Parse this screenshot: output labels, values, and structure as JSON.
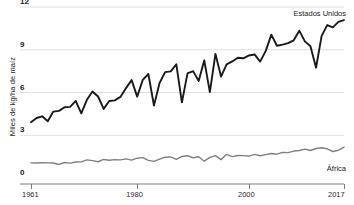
{
  "chart_data": {
    "type": "line",
    "title": "",
    "xlabel": "",
    "ylabel": "Miles de kg/ha de maíz",
    "xlim": [
      1961,
      2017
    ],
    "ylim": [
      0,
      12
    ],
    "grid": true,
    "legend_position": "inline-right",
    "yticks": [
      "0",
      "3",
      "6",
      "9",
      "12"
    ],
    "ytick_values": [
      0,
      3,
      6,
      9,
      12
    ],
    "xticks": [
      "1961",
      "1980",
      "2000",
      "2017"
    ],
    "xtick_values": [
      1961,
      1980,
      2000,
      2017
    ],
    "x": [
      1961,
      1962,
      1963,
      1964,
      1965,
      1966,
      1967,
      1968,
      1969,
      1970,
      1971,
      1972,
      1973,
      1974,
      1975,
      1976,
      1977,
      1978,
      1979,
      1980,
      1981,
      1982,
      1983,
      1984,
      1985,
      1986,
      1987,
      1988,
      1989,
      1990,
      1991,
      1992,
      1993,
      1994,
      1995,
      1996,
      1997,
      1998,
      1999,
      2000,
      2001,
      2002,
      2003,
      2004,
      2005,
      2006,
      2007,
      2008,
      2009,
      2010,
      2011,
      2012,
      2013,
      2014,
      2015,
      2016,
      2017
    ],
    "series": [
      {
        "name": "Estados Unidos",
        "color": "#1a1a1a",
        "label_x": 2014,
        "label_y": 11.6,
        "values": [
          3.92,
          4.21,
          4.33,
          3.98,
          4.66,
          4.71,
          4.96,
          4.99,
          5.41,
          4.54,
          5.49,
          6.07,
          5.72,
          4.85,
          5.4,
          5.45,
          5.69,
          6.31,
          6.87,
          5.71,
          6.89,
          7.3,
          5.08,
          6.67,
          7.43,
          7.48,
          7.98,
          5.31,
          7.34,
          7.5,
          6.81,
          8.26,
          6.03,
          8.71,
          7.12,
          7.97,
          8.18,
          8.44,
          8.4,
          8.6,
          8.67,
          8.17,
          8.92,
          10.06,
          9.28,
          9.36,
          9.46,
          9.66,
          10.34,
          9.59,
          9.24,
          7.74,
          9.97,
          10.73,
          10.57,
          10.96,
          11.08
        ]
      },
      {
        "name": "África",
        "color": "#808080",
        "label_x": 2014,
        "label_y": 0.72,
        "values": [
          1.06,
          1.05,
          1.08,
          1.06,
          1.05,
          0.95,
          1.09,
          1.04,
          1.12,
          1.13,
          1.27,
          1.22,
          1.14,
          1.3,
          1.25,
          1.29,
          1.27,
          1.34,
          1.25,
          1.39,
          1.43,
          1.24,
          1.17,
          1.32,
          1.46,
          1.48,
          1.3,
          1.51,
          1.56,
          1.42,
          1.49,
          1.18,
          1.45,
          1.57,
          1.29,
          1.66,
          1.5,
          1.58,
          1.57,
          1.54,
          1.66,
          1.56,
          1.64,
          1.72,
          1.67,
          1.8,
          1.78,
          1.89,
          1.93,
          2.03,
          1.93,
          2.07,
          2.12,
          2.05,
          1.86,
          1.95,
          2.17
        ]
      }
    ]
  },
  "axis": {
    "y_title": "Miles de kg/ha de maíz"
  },
  "colors": {
    "grid": "#d8d8d8",
    "axis": "#6e6e6e",
    "us_line": "#1a1a1a",
    "africa_line": "#808080",
    "background": "#ffffff"
  }
}
